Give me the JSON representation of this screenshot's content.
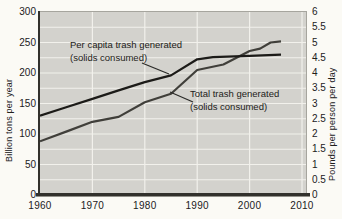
{
  "chart_data": {
    "type": "line",
    "title": "",
    "grid": true,
    "plot_bg_color": "#d3d2cd",
    "grid_color": "#f2f1ec",
    "x_axis": {
      "ticks": [
        "1960",
        "1970",
        "1980",
        "1990",
        "2000",
        "2010"
      ],
      "min": 1960,
      "max": 2010
    },
    "left_axis": {
      "label": "Billion tons per year",
      "ticks": [
        "300",
        "250",
        "200",
        "150",
        "100",
        "50",
        "0"
      ],
      "min": 0,
      "max": 300
    },
    "right_axis": {
      "label": "Pounds per person per day",
      "ticks": [
        "6",
        "5.5",
        "5",
        "4.5",
        "4",
        "3.5",
        "3",
        "2.5",
        "2",
        "1.5",
        "1",
        "0.5",
        "0"
      ],
      "min": 0,
      "max": 6
    },
    "series": [
      {
        "name": "Total trash generated (solids consumed)",
        "axis": "left",
        "color": "#403f3a",
        "x": [
          1960,
          1965,
          1970,
          1975,
          1980,
          1985,
          1990,
          1995,
          2000,
          2002,
          2004,
          2006
        ],
        "y": [
          88,
          104,
          120,
          128,
          152,
          166,
          205,
          214,
          236,
          240,
          250,
          252
        ]
      },
      {
        "name": "Per capita trash generated (solids consumed)",
        "axis": "right",
        "color": "#1c1b18",
        "x": [
          1960,
          1965,
          1970,
          1975,
          1980,
          1985,
          1990,
          1993,
          2000,
          2006
        ],
        "y": [
          2.6,
          2.88,
          3.15,
          3.43,
          3.7,
          3.92,
          4.45,
          4.52,
          4.56,
          4.6
        ]
      }
    ],
    "annotations": [
      {
        "lines": [
          "Per capita trash generated",
          "(solids consumed)"
        ],
        "x": 30,
        "y": 27,
        "leader": [
          [
            102,
            51
          ],
          [
            129,
            62
          ]
        ]
      },
      {
        "lines": [
          "Total trash generated",
          "(solids consumed)"
        ],
        "x": 150,
        "y": 76,
        "leader": [
          [
            153,
            90
          ],
          [
            130,
            80
          ]
        ]
      }
    ]
  }
}
